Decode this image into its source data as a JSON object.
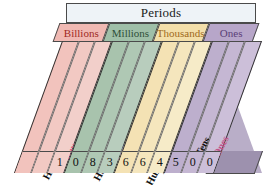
{
  "header": {
    "title": "Periods"
  },
  "periods": [
    {
      "label": "Billions",
      "band_color": "#f0b9b3",
      "text_color": "#9e2a23",
      "columns": 3
    },
    {
      "label": "Millions",
      "band_color": "#9fbfa8",
      "text_color": "#2f4f3a",
      "columns": 3
    },
    {
      "label": "Thousands",
      "band_color": "#f3dfaa",
      "text_color": "#a06a20",
      "columns": 3
    },
    {
      "label": "Ones",
      "band_color": "#b7a6c9",
      "text_color": "#5b3f78",
      "columns": 3
    }
  ],
  "columns": [
    {
      "label": "Hundred-billions",
      "digit": "",
      "column_color": "#f2c3bd",
      "label_color": "#111111",
      "period": "Billions"
    },
    {
      "label": "Ten-billions",
      "digit": "",
      "column_color": "#f2c9c3",
      "label_color": "#111111",
      "period": "Billions"
    },
    {
      "label": "Billions",
      "digit": "1",
      "column_color": "#f2cfca",
      "label_color": "#d9547c",
      "period": "Billions"
    },
    {
      "label": "Hundred-millions",
      "digit": "0",
      "column_color": "#a8c3ad",
      "label_color": "#111111",
      "period": "Millions"
    },
    {
      "label": "Ten-millions",
      "digit": "8",
      "column_color": "#afc8b4",
      "label_color": "#111111",
      "period": "Millions"
    },
    {
      "label": "Millions",
      "digit": "3",
      "column_color": "#b8cdbd",
      "label_color": "#a0899b",
      "period": "Millions"
    },
    {
      "label": "Hundred-thousands",
      "digit": "6",
      "column_color": "#f4e2b4",
      "label_color": "#111111",
      "period": "Thousands"
    },
    {
      "label": "Ten-thousands",
      "digit": "6",
      "column_color": "#f5e6bd",
      "label_color": "#111111",
      "period": "Thousands"
    },
    {
      "label": "Thousands",
      "digit": "4",
      "column_color": "#f6ebc8",
      "label_color": "#d2604a",
      "period": "Thousands"
    },
    {
      "label": "Hundreds",
      "digit": "5",
      "column_color": "#bdafcd",
      "label_color": "#111111",
      "period": "Ones"
    },
    {
      "label": "Tens",
      "digit": "0",
      "column_color": "#c5b7d3",
      "label_color": "#111111",
      "period": "Ones"
    },
    {
      "label": "Ones",
      "digit": "0",
      "column_color": "#ccbfd9",
      "label_color": "#c0558a",
      "period": "Ones"
    }
  ],
  "number_read": "108,366,4500",
  "colors": {
    "outline": "#4a4a4a",
    "page_background": "#ffffff",
    "side_face": "#b9aec8",
    "header_background": "#eef3f7"
  }
}
